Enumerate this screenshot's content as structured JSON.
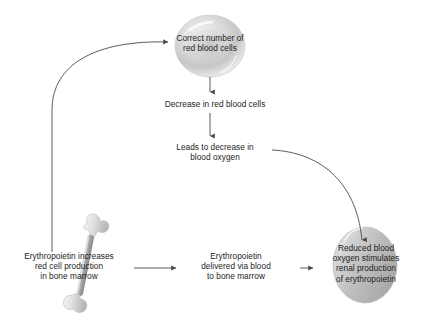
{
  "diagram": {
    "background_color": "#ffffff",
    "text_color": "#1d1d1d",
    "arrow_color": "#4a4a4a",
    "nodes": {
      "red_blood_cells": {
        "label": "Correct number of\nred blood cells",
        "shape": "red-blood-cell",
        "fill": "#d9d9d9"
      },
      "decrease_rbc": {
        "label": "Decrease in red blood cells",
        "shape": "text"
      },
      "decrease_oxygen": {
        "label": "Leads to decrease in\nblood oxygen",
        "shape": "text"
      },
      "kidney": {
        "label": "Reduced blood\noxygen stimulates\nrenal production\nof erythropoietin",
        "shape": "kidney",
        "fill": "#c8c8c8"
      },
      "delivered": {
        "label": "Erythropoietin\ndelivered via blood\nto bone marrow",
        "shape": "text"
      },
      "bone_marrow": {
        "label": "Erythropoietin increases\nred cell production\nin bone marrow",
        "shape": "femur-bone",
        "fill": "#d3d3d3"
      }
    },
    "edges": [
      {
        "name": "rbc-to-decrease",
        "from": "red_blood_cells",
        "to": "decrease_rbc",
        "style": "straight-down"
      },
      {
        "name": "decrease-to-oxygen",
        "from": "decrease_rbc",
        "to": "decrease_oxygen",
        "style": "straight-down"
      },
      {
        "name": "oxygen-to-kidney",
        "from": "decrease_oxygen",
        "to": "kidney",
        "style": "curve-right-down"
      },
      {
        "name": "kidney-to-delivered",
        "from": "kidney",
        "to": "delivered",
        "style": "straight-left"
      },
      {
        "name": "delivered-to-marrow",
        "from": "delivered",
        "to": "bone_marrow",
        "style": "straight-left"
      },
      {
        "name": "marrow-to-rbc",
        "from": "bone_marrow",
        "to": "red_blood_cells",
        "style": "curve-up-right"
      }
    ]
  }
}
